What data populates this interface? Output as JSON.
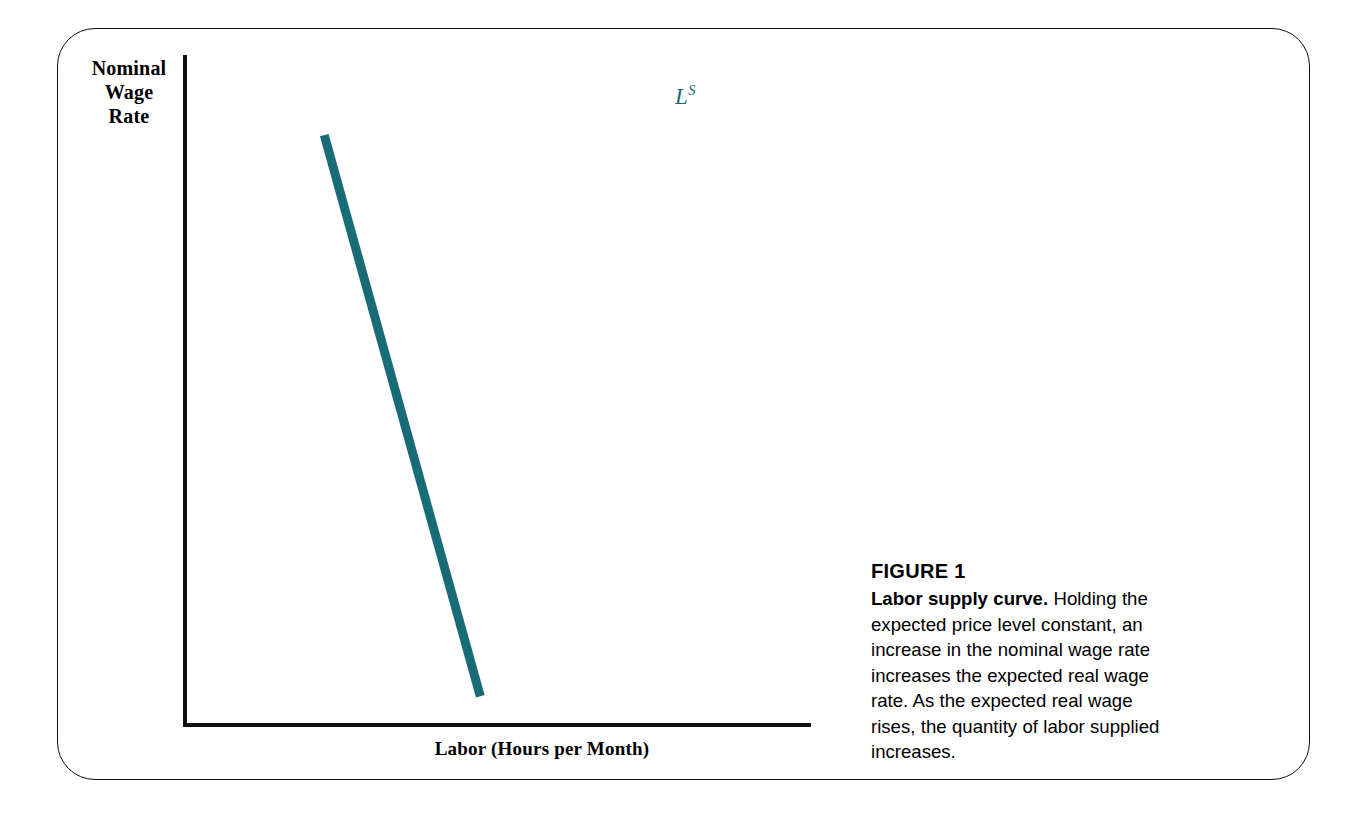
{
  "figure": {
    "frame_border_color": "#0d0d0d",
    "background_color": "#ffffff"
  },
  "chart_data": {
    "type": "line",
    "title": "Labor supply curve",
    "xlabel": "Labor (Hours per Month)",
    "ylabel": "Nominal Wage Rate",
    "axis_color": "#111111",
    "series": [
      {
        "name": "L^S",
        "label_text": "L",
        "label_superscript": "S",
        "color": "#1a6b78",
        "line_width_px": 9,
        "points": [
          {
            "x": 0.47,
            "y": 0.04
          },
          {
            "x": 0.22,
            "y": 0.88
          }
        ],
        "description": "Upward-sloping straight labor supply curve running from lower-left to upper-right"
      }
    ],
    "xlim": [
      0,
      1
    ],
    "ylim": [
      0,
      1
    ],
    "grid": false,
    "tick_labels": [],
    "legend": "inline-curve-label"
  },
  "axes": {
    "y_label": "Nominal Wage Rate",
    "y_label_lines": [
      "Nominal",
      "Wage",
      "Rate"
    ],
    "x_label": "Labor (Hours per Month)"
  },
  "curve": {
    "label": "L",
    "superscript": "S",
    "color": "#1a6b78"
  },
  "caption": {
    "figure_number": "FIGURE 1",
    "lead": "Labor supply curve.",
    "body": " Holding the expected price level constant, an increase in the nominal wage rate increases the expected real wage rate. As the expected real wage rises, the quantity of labor supplied increases."
  }
}
